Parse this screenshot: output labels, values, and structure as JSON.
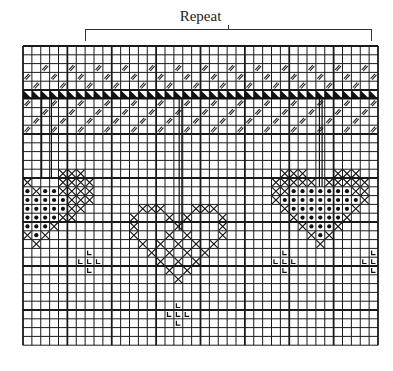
{
  "title": "Repeat",
  "grid": {
    "cols": 40,
    "rows": 34,
    "cell_w": 8.875,
    "cell_h": 8.8,
    "thick_every": 5,
    "line_color": "#1a1a1a"
  },
  "legend_symbols": {
    "slash": "double-diagonal-stitch",
    "tri": "black-triangle",
    "x": "cross-stitch",
    "dot": "filled-dot",
    "L": "corner-L-stitch"
  },
  "bands": {
    "slash_rows": [
      {
        "row": 2,
        "start": 2,
        "step": 3
      },
      {
        "row": 3,
        "start": 0,
        "step": 3
      },
      {
        "row": 4,
        "start": 1,
        "step": 3
      },
      {
        "row": 6,
        "start": 0,
        "step": 3
      },
      {
        "row": 7,
        "start": 2,
        "step": 3
      },
      {
        "row": 8,
        "start": 1,
        "step": 3
      },
      {
        "row": 9,
        "start": 0,
        "step": 3
      }
    ],
    "triangle_row": 5
  },
  "hearts": [
    {
      "name": "left-heart",
      "x": [
        [
          14,
          4
        ],
        [
          14,
          5
        ],
        [
          14,
          6
        ],
        [
          15,
          0
        ],
        [
          15,
          4
        ],
        [
          15,
          5
        ],
        [
          15,
          6
        ],
        [
          15,
          7
        ],
        [
          16,
          1
        ],
        [
          16,
          4
        ],
        [
          16,
          5
        ],
        [
          16,
          6
        ],
        [
          16,
          7
        ],
        [
          17,
          5
        ],
        [
          17,
          6
        ],
        [
          17,
          7
        ],
        [
          18,
          5
        ],
        [
          18,
          6
        ],
        [
          19,
          4
        ],
        [
          19,
          5
        ],
        [
          20,
          3
        ],
        [
          21,
          0
        ],
        [
          21,
          2
        ],
        [
          22,
          1
        ]
      ],
      "dot": [
        [
          16,
          0
        ],
        [
          16,
          2
        ],
        [
          16,
          3
        ],
        [
          17,
          0
        ],
        [
          17,
          1
        ],
        [
          17,
          2
        ],
        [
          17,
          3
        ],
        [
          17,
          4
        ],
        [
          18,
          0
        ],
        [
          18,
          1
        ],
        [
          18,
          2
        ],
        [
          18,
          3
        ],
        [
          18,
          4
        ],
        [
          19,
          0
        ],
        [
          19,
          1
        ],
        [
          19,
          2
        ],
        [
          19,
          3
        ],
        [
          20,
          0
        ],
        [
          20,
          1
        ],
        [
          20,
          2
        ],
        [
          21,
          1
        ]
      ]
    },
    {
      "name": "middle-heart",
      "x": [
        [
          18,
          13
        ],
        [
          18,
          14
        ],
        [
          18,
          15
        ],
        [
          18,
          19
        ],
        [
          18,
          20
        ],
        [
          18,
          21
        ],
        [
          19,
          12
        ],
        [
          19,
          16
        ],
        [
          19,
          18
        ],
        [
          19,
          22
        ],
        [
          20,
          12
        ],
        [
          20,
          17
        ],
        [
          20,
          22
        ],
        [
          21,
          12
        ],
        [
          21,
          16
        ],
        [
          21,
          18
        ],
        [
          21,
          22
        ],
        [
          22,
          13
        ],
        [
          22,
          15
        ],
        [
          22,
          17
        ],
        [
          22,
          19
        ],
        [
          22,
          21
        ],
        [
          23,
          14
        ],
        [
          23,
          16
        ],
        [
          23,
          18
        ],
        [
          23,
          20
        ],
        [
          24,
          15
        ],
        [
          24,
          17
        ],
        [
          24,
          19
        ],
        [
          25,
          16
        ],
        [
          25,
          18
        ],
        [
          26,
          17
        ]
      ]
    },
    {
      "name": "right-heart",
      "x": [
        [
          14,
          29
        ],
        [
          14,
          30
        ],
        [
          14,
          31
        ],
        [
          14,
          35
        ],
        [
          14,
          36
        ],
        [
          14,
          37
        ],
        [
          15,
          28
        ],
        [
          15,
          29
        ],
        [
          15,
          30
        ],
        [
          15,
          31
        ],
        [
          15,
          32
        ],
        [
          15,
          34
        ],
        [
          15,
          35
        ],
        [
          15,
          36
        ],
        [
          15,
          37
        ],
        [
          15,
          38
        ],
        [
          16,
          28
        ],
        [
          16,
          29
        ],
        [
          16,
          37
        ],
        [
          16,
          38
        ],
        [
          17,
          28
        ],
        [
          17,
          38
        ],
        [
          18,
          29
        ],
        [
          18,
          37
        ],
        [
          19,
          30
        ],
        [
          19,
          36
        ],
        [
          20,
          31
        ],
        [
          20,
          35
        ],
        [
          21,
          32
        ],
        [
          21,
          34
        ],
        [
          22,
          33
        ]
      ],
      "dot": [
        [
          16,
          30
        ],
        [
          16,
          31
        ],
        [
          16,
          32
        ],
        [
          16,
          33
        ],
        [
          16,
          34
        ],
        [
          16,
          35
        ],
        [
          16,
          36
        ],
        [
          17,
          29
        ],
        [
          17,
          30
        ],
        [
          17,
          31
        ],
        [
          17,
          32
        ],
        [
          17,
          33
        ],
        [
          17,
          34
        ],
        [
          17,
          35
        ],
        [
          17,
          36
        ],
        [
          17,
          37
        ],
        [
          18,
          30
        ],
        [
          18,
          31
        ],
        [
          18,
          32
        ],
        [
          18,
          33
        ],
        [
          18,
          34
        ],
        [
          18,
          35
        ],
        [
          18,
          36
        ],
        [
          19,
          31
        ],
        [
          19,
          32
        ],
        [
          19,
          33
        ],
        [
          19,
          34
        ],
        [
          19,
          35
        ],
        [
          20,
          32
        ],
        [
          20,
          33
        ],
        [
          20,
          34
        ],
        [
          21,
          33
        ]
      ]
    }
  ],
  "l_marks": [
    [
      23,
      7
    ],
    [
      24,
      6
    ],
    [
      24,
      7
    ],
    [
      24,
      8
    ],
    [
      25,
      7
    ],
    [
      23,
      29
    ],
    [
      24,
      28
    ],
    [
      24,
      29
    ],
    [
      24,
      30
    ],
    [
      25,
      29
    ],
    [
      23,
      39
    ],
    [
      24,
      38
    ],
    [
      24,
      39
    ],
    [
      25,
      39
    ],
    [
      29,
      17
    ],
    [
      30,
      16
    ],
    [
      30,
      17
    ],
    [
      30,
      18
    ],
    [
      31,
      17
    ]
  ],
  "threads": [
    {
      "col": 2.1,
      "from_row": 6,
      "to_row": 15
    },
    {
      "col": 3.2,
      "from_row": 6,
      "to_row": 15
    },
    {
      "col": 17.6,
      "from_row": 6,
      "to_row": 21
    },
    {
      "col": 17.9,
      "from_row": 6,
      "to_row": 21
    },
    {
      "col": 33.4,
      "from_row": 6,
      "to_row": 16
    },
    {
      "col": 33.7,
      "from_row": 6,
      "to_row": 16
    }
  ]
}
